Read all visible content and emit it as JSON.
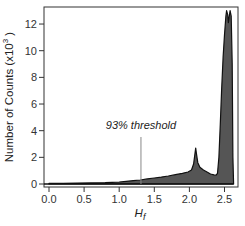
{
  "chart_data": {
    "type": "area",
    "title": "",
    "xlabel": "H_f",
    "xlabel_main": "H",
    "xlabel_sub": "f",
    "ylabel": "Number of Counts (x10³)",
    "ylabel_text": "Number of Counts (x10",
    "ylabel_sup": "3",
    "ylabel_close": ")",
    "xlim": [
      -0.07,
      2.7
    ],
    "ylim": [
      -0.1,
      13.3
    ],
    "xticks": [
      0.0,
      0.5,
      1.0,
      1.5,
      2.0,
      2.5
    ],
    "xtick_labels": [
      "0.0",
      "0.5",
      "1.0",
      "1.5",
      "2.0",
      "2.5"
    ],
    "yticks": [
      0,
      2,
      4,
      6,
      8,
      10,
      12
    ],
    "ytick_labels": [
      "0",
      "2",
      "4",
      "6",
      "8",
      "10",
      "12"
    ],
    "grid": false,
    "legend": null,
    "fill_color": "#555555",
    "line_color": "#111111",
    "series": [
      {
        "name": "histogram",
        "x": [
          0.0,
          0.2,
          0.4,
          0.6,
          0.8,
          0.9,
          1.0,
          1.1,
          1.2,
          1.3,
          1.4,
          1.5,
          1.6,
          1.7,
          1.8,
          1.9,
          1.98,
          2.03,
          2.06,
          2.08,
          2.09,
          2.1,
          2.12,
          2.15,
          2.2,
          2.25,
          2.3,
          2.35,
          2.38,
          2.4,
          2.42,
          2.44,
          2.46,
          2.48,
          2.5,
          2.52,
          2.53,
          2.545,
          2.555,
          2.565,
          2.58,
          2.595,
          2.61,
          2.62,
          2.63
        ],
        "y": [
          0.05,
          0.05,
          0.06,
          0.08,
          0.1,
          0.12,
          0.15,
          0.2,
          0.25,
          0.3,
          0.38,
          0.45,
          0.52,
          0.6,
          0.7,
          0.8,
          0.9,
          1.05,
          1.5,
          2.3,
          2.7,
          2.3,
          1.6,
          1.25,
          1.05,
          0.9,
          0.75,
          0.68,
          0.66,
          0.8,
          2.0,
          4.5,
          7.2,
          9.5,
          11.2,
          12.6,
          13.0,
          12.7,
          12.1,
          12.5,
          13.0,
          12.6,
          9.0,
          2.0,
          0.0
        ]
      }
    ],
    "annotations": [
      {
        "text": "93% threshold",
        "x": 1.31,
        "type": "vertical-line",
        "label_y": 4.2
      }
    ]
  }
}
